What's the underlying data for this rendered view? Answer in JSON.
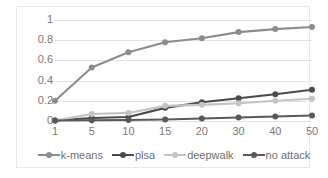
{
  "chart_data": {
    "type": "line",
    "title": "",
    "xlabel": "",
    "ylabel": "",
    "categories": [
      "1",
      "5",
      "10",
      "15",
      "20",
      "30",
      "40",
      "50"
    ],
    "ylim": [
      0,
      1
    ],
    "yticks": [
      "1",
      "0.8",
      "0.6",
      "0.4",
      "0.2",
      "0"
    ],
    "ytick_values": [
      1,
      0.8,
      0.6,
      0.4,
      0.2,
      0
    ],
    "grid": true,
    "legend_position": "bottom",
    "series": [
      {
        "name": "k-means",
        "color": "#8c8c8c",
        "values": [
          0.2,
          0.53,
          0.68,
          0.78,
          0.82,
          0.88,
          0.91,
          0.93
        ]
      },
      {
        "name": "plsa",
        "color": "#4a4a4a",
        "values": [
          0.005,
          0.03,
          0.04,
          0.13,
          0.185,
          0.225,
          0.265,
          0.31
        ]
      },
      {
        "name": "deepwalk",
        "color": "#c4c4c4",
        "values": [
          0.005,
          0.07,
          0.08,
          0.15,
          0.16,
          0.175,
          0.2,
          0.22
        ]
      },
      {
        "name": "no attack",
        "color": "#595959",
        "values": [
          0.005,
          0.008,
          0.01,
          0.015,
          0.025,
          0.035,
          0.045,
          0.055
        ]
      }
    ]
  },
  "legend": {
    "items": [
      {
        "label": "k-means"
      },
      {
        "label": "plsa"
      },
      {
        "label": "deepwalk"
      },
      {
        "label": "no attack"
      }
    ]
  }
}
